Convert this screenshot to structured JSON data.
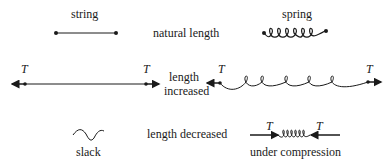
{
  "labels": {
    "string": "string",
    "spring": "spring",
    "natural_length": "natural length",
    "length_increased_line1": "length",
    "length_increased_line2": "increased",
    "length_decreased": "length decreased",
    "slack": "slack",
    "under_compression": "under compression",
    "tension_symbol": "T"
  },
  "rows": [
    {
      "condition": "natural length",
      "string": "straight string with end points",
      "spring": "spring with end points"
    },
    {
      "condition": "length increased",
      "string": "taut string with tension T at both ends, arrows outward",
      "spring": "stretched spring with tension T at both ends, arrows outward"
    },
    {
      "condition": "length decreased",
      "string": "slack",
      "spring": "under compression, arrows T inward"
    }
  ],
  "colors": {
    "ink": "#1a1a1a",
    "background": "#ffffff"
  }
}
